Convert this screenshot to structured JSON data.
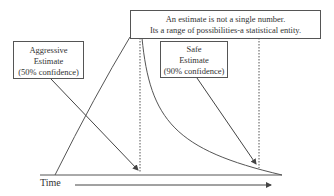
{
  "headline_box": {
    "line1": "An estimate is not a single number.",
    "line2": "Its a range of possibilities-a statistical entity."
  },
  "aggressive_box": {
    "line1": "Aggressive",
    "line2": "Estimate",
    "line3": "(50% confidence)"
  },
  "safe_box": {
    "line1": "Safe",
    "line2": "Estimate",
    "line3": "(90% confidence)"
  },
  "axis": {
    "time_label": "Time"
  },
  "colors": {
    "line": "#555555",
    "background": "#ffffff"
  }
}
